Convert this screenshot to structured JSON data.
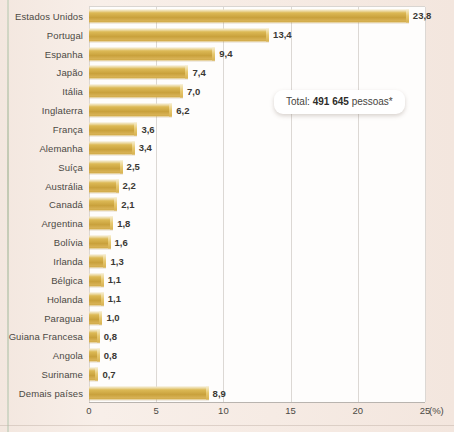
{
  "chart_data": {
    "type": "bar",
    "orientation": "horizontal",
    "title": "",
    "xlabel": "(%)",
    "ylabel": "",
    "xlim": [
      0,
      25
    ],
    "xticks": [
      0,
      5,
      10,
      15,
      20,
      25
    ],
    "xtick_labels": [
      "0",
      "5",
      "10",
      "15",
      "20",
      "25"
    ],
    "grid": "vertical",
    "legend": "none",
    "value_label_format": "comma-decimal",
    "categories": [
      "Estados Unidos",
      "Portugal",
      "Espanha",
      "Japão",
      "Itália",
      "Inglaterra",
      "França",
      "Alemanha",
      "Suíça",
      "Austrália",
      "Canadá",
      "Argentina",
      "Bolívia",
      "Irlanda",
      "Bélgica",
      "Holanda",
      "Paraguai",
      "Guiana Francesa",
      "Angola",
      "Suriname",
      "Demais países"
    ],
    "values": [
      23.8,
      13.4,
      9.4,
      7.4,
      7.0,
      6.2,
      3.6,
      3.4,
      2.5,
      2.2,
      2.1,
      1.8,
      1.6,
      1.3,
      1.1,
      1.1,
      1.0,
      0.8,
      0.8,
      0.7,
      8.9
    ],
    "value_labels": [
      "23,8",
      "13,4",
      "9,4",
      "7,4",
      "7,0",
      "6,2",
      "3,6",
      "3,4",
      "2,5",
      "2,2",
      "2,1",
      "1,8",
      "1,6",
      "1,3",
      "1,1",
      "1,1",
      "1,0",
      "0,8",
      "0,8",
      "0,7",
      "8,9"
    ],
    "annotations": [
      {
        "name": "total-callout",
        "prefix": "Total:",
        "number": "491 645",
        "suffix": "pessoas*"
      }
    ],
    "colors": {
      "bar_light": "#efe0b2",
      "bar_mid": "#dcb955",
      "bar_dark": "#c9a13c",
      "plot_background": "#fefdfc",
      "page_background": "#f5e9e2",
      "text": "#4c4944",
      "gridline": "#dcd8d4"
    }
  }
}
